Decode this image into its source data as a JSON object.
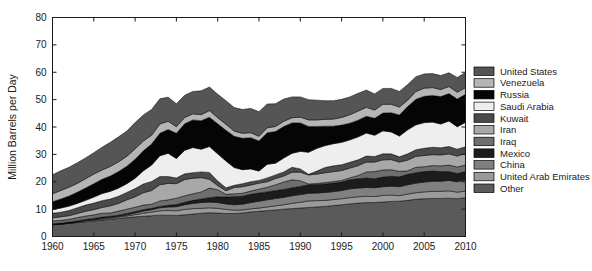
{
  "chart_data": {
    "type": "area",
    "title": "",
    "subtitle": "",
    "xlabel": "",
    "ylabel": "Million Barrels per Day",
    "xlim": [
      1960,
      2010
    ],
    "ylim": [
      0,
      80
    ],
    "xticks": [
      1960,
      1965,
      1970,
      1975,
      1980,
      1985,
      1990,
      1995,
      2000,
      2005,
      2010
    ],
    "yticks": [
      0,
      10,
      20,
      30,
      40,
      50,
      60,
      70,
      80
    ],
    "xtick_labels": [
      "1960",
      "1965",
      "1970",
      "1975",
      "1980",
      "1985",
      "1990",
      "1995",
      "2000",
      "2005",
      "2010"
    ],
    "ytick_labels": [
      "0",
      "10",
      "20",
      "30",
      "40",
      "50",
      "60",
      "70",
      "80"
    ],
    "grid": false,
    "stacked": true,
    "legend_position": "right",
    "x": [
      1960,
      1961,
      1962,
      1963,
      1964,
      1965,
      1966,
      1967,
      1968,
      1969,
      1970,
      1971,
      1972,
      1973,
      1974,
      1975,
      1976,
      1977,
      1978,
      1979,
      1980,
      1981,
      1982,
      1983,
      1984,
      1985,
      1986,
      1987,
      1988,
      1989,
      1990,
      1991,
      1992,
      1993,
      1994,
      1995,
      1996,
      1997,
      1998,
      1999,
      2000,
      2001,
      2002,
      2003,
      2004,
      2005,
      2006,
      2007,
      2008,
      2009,
      2010
    ],
    "series": [
      {
        "name": "Other",
        "color": "#5a5a5a",
        "values": [
          4.3,
          4.5,
          4.8,
          5.1,
          5.4,
          5.7,
          6.0,
          6.3,
          6.6,
          6.9,
          7.2,
          7.4,
          7.6,
          7.8,
          7.8,
          7.7,
          7.9,
          8.2,
          8.5,
          8.7,
          8.6,
          8.4,
          8.4,
          8.6,
          9.0,
          9.2,
          9.5,
          9.7,
          10.0,
          10.2,
          10.4,
          10.6,
          10.8,
          11.0,
          11.3,
          11.6,
          11.9,
          12.2,
          12.4,
          12.4,
          12.6,
          12.8,
          12.9,
          13.2,
          13.6,
          13.8,
          13.9,
          13.9,
          14.0,
          13.8,
          14.2
        ]
      },
      {
        "name": "United Arab Emirates",
        "color": "#9a9a9a",
        "values": [
          0.0,
          0.0,
          0.1,
          0.2,
          0.3,
          0.3,
          0.4,
          0.4,
          0.5,
          0.6,
          0.8,
          1.1,
          1.3,
          1.6,
          1.7,
          1.7,
          2.0,
          2.0,
          1.8,
          1.8,
          1.7,
          1.5,
          1.2,
          1.1,
          1.1,
          1.2,
          1.3,
          1.5,
          1.6,
          1.9,
          2.1,
          2.4,
          2.3,
          2.2,
          2.2,
          2.2,
          2.3,
          2.3,
          2.3,
          2.2,
          2.4,
          2.3,
          2.0,
          2.3,
          2.4,
          2.5,
          2.6,
          2.6,
          2.7,
          2.4,
          2.4
        ]
      },
      {
        "name": "China",
        "color": "#808080",
        "values": [
          0.1,
          0.1,
          0.1,
          0.1,
          0.2,
          0.2,
          0.3,
          0.3,
          0.3,
          0.4,
          0.6,
          0.8,
          0.9,
          1.1,
          1.3,
          1.5,
          1.7,
          1.9,
          2.1,
          2.1,
          2.1,
          2.0,
          2.0,
          2.1,
          2.3,
          2.5,
          2.6,
          2.7,
          2.7,
          2.8,
          2.8,
          2.8,
          2.8,
          2.9,
          2.9,
          3.0,
          3.2,
          3.2,
          3.2,
          3.2,
          3.2,
          3.3,
          3.3,
          3.4,
          3.5,
          3.6,
          3.7,
          3.7,
          3.8,
          3.8,
          4.1
        ]
      },
      {
        "name": "Mexico",
        "color": "#1c1c1c",
        "values": [
          0.3,
          0.3,
          0.3,
          0.3,
          0.3,
          0.4,
          0.4,
          0.4,
          0.4,
          0.5,
          0.5,
          0.5,
          0.5,
          0.5,
          0.6,
          0.8,
          0.9,
          1.1,
          1.3,
          1.6,
          2.1,
          2.5,
          3.0,
          2.9,
          3.0,
          3.0,
          2.9,
          2.9,
          2.9,
          2.9,
          3.0,
          3.1,
          3.1,
          3.1,
          3.1,
          3.1,
          3.3,
          3.4,
          3.5,
          3.3,
          3.5,
          3.6,
          3.6,
          3.8,
          3.8,
          3.8,
          3.7,
          3.5,
          3.2,
          3.0,
          3.0
        ]
      },
      {
        "name": "Iraq",
        "color": "#6e6e6e",
        "values": [
          1.0,
          1.0,
          1.0,
          1.2,
          1.3,
          1.3,
          1.4,
          1.2,
          1.5,
          1.6,
          1.6,
          1.7,
          1.5,
          2.0,
          2.0,
          2.3,
          2.4,
          2.4,
          2.6,
          3.5,
          2.6,
          1.0,
          1.0,
          1.1,
          1.2,
          1.4,
          1.7,
          2.1,
          2.7,
          2.9,
          2.1,
          0.3,
          0.4,
          0.5,
          0.6,
          0.6,
          0.7,
          1.2,
          2.2,
          2.6,
          2.6,
          2.4,
          2.0,
          1.3,
          2.0,
          1.8,
          2.0,
          2.1,
          2.4,
          2.4,
          2.4
        ]
      },
      {
        "name": "Iran",
        "color": "#a8a8a8",
        "values": [
          1.1,
          1.3,
          1.3,
          1.5,
          1.7,
          1.9,
          2.1,
          2.6,
          2.8,
          3.4,
          3.8,
          4.5,
          5.0,
          5.9,
          6.0,
          5.3,
          5.9,
          5.7,
          5.2,
          3.2,
          1.5,
          1.3,
          2.3,
          2.4,
          2.2,
          2.2,
          2.0,
          2.3,
          2.2,
          2.8,
          3.1,
          3.3,
          3.4,
          3.6,
          3.6,
          3.6,
          3.6,
          3.6,
          3.6,
          3.5,
          3.7,
          3.7,
          3.4,
          3.9,
          4.0,
          4.1,
          4.0,
          4.0,
          4.1,
          4.0,
          4.2
        ]
      },
      {
        "name": "Kuwait",
        "color": "#4a4a4a",
        "values": [
          1.7,
          1.7,
          1.9,
          2.1,
          2.3,
          2.4,
          2.5,
          2.5,
          2.6,
          2.7,
          3.0,
          3.2,
          3.3,
          3.0,
          2.5,
          2.1,
          2.1,
          2.0,
          2.1,
          2.5,
          1.7,
          1.1,
          0.8,
          1.1,
          1.2,
          1.0,
          1.4,
          1.3,
          1.5,
          1.8,
          1.2,
          0.2,
          1.1,
          1.9,
          2.1,
          2.1,
          2.1,
          2.1,
          2.2,
          2.0,
          2.2,
          2.1,
          1.9,
          2.3,
          2.4,
          2.6,
          2.7,
          2.6,
          2.7,
          2.5,
          2.5
        ]
      },
      {
        "name": "Saudi Arabia",
        "color": "#eeeeee",
        "values": [
          1.3,
          1.5,
          1.6,
          1.6,
          1.7,
          2.2,
          2.6,
          2.8,
          3.0,
          3.2,
          3.8,
          4.8,
          6.0,
          7.6,
          8.5,
          7.1,
          8.6,
          9.2,
          8.3,
          9.5,
          9.9,
          9.8,
          6.5,
          5.1,
          4.7,
          3.4,
          5.0,
          4.3,
          5.1,
          5.1,
          6.4,
          8.1,
          8.3,
          8.0,
          8.1,
          8.2,
          8.2,
          8.4,
          8.4,
          7.8,
          8.4,
          8.0,
          7.6,
          8.8,
          9.1,
          9.4,
          9.2,
          8.7,
          9.3,
          8.2,
          8.9
        ]
      },
      {
        "name": "Russia",
        "color": "#050505",
        "values": [
          2.9,
          3.3,
          3.7,
          4.1,
          4.5,
          4.9,
          5.2,
          5.6,
          6.0,
          6.4,
          6.9,
          7.3,
          7.7,
          8.2,
          8.7,
          9.2,
          9.7,
          10.1,
          10.4,
          10.7,
          11.0,
          11.2,
          11.4,
          11.5,
          11.4,
          11.0,
          11.5,
          11.6,
          11.5,
          11.1,
          10.4,
          9.4,
          8.0,
          7.1,
          6.4,
          6.3,
          6.1,
          6.1,
          6.1,
          6.2,
          6.5,
          7.0,
          7.7,
          8.5,
          9.3,
          9.6,
          9.7,
          10.0,
          10.0,
          10.1,
          10.3
        ]
      },
      {
        "name": "Venezuela",
        "color": "#b5b5b5",
        "values": [
          2.9,
          3.1,
          3.2,
          3.2,
          3.4,
          3.5,
          3.4,
          3.5,
          3.6,
          3.6,
          3.8,
          3.6,
          3.2,
          3.4,
          3.0,
          2.4,
          2.3,
          2.2,
          2.2,
          2.4,
          2.2,
          2.2,
          1.9,
          1.8,
          1.8,
          1.7,
          1.8,
          1.8,
          1.9,
          1.9,
          2.1,
          2.4,
          2.4,
          2.5,
          2.6,
          2.8,
          3.1,
          3.3,
          3.3,
          3.0,
          3.2,
          3.1,
          2.9,
          2.3,
          2.9,
          3.0,
          2.9,
          2.6,
          2.6,
          2.5,
          2.4
        ]
      },
      {
        "name": "United States",
        "color": "#555555",
        "values": [
          7.0,
          7.2,
          7.3,
          7.5,
          7.6,
          7.8,
          8.3,
          8.8,
          9.1,
          9.2,
          9.6,
          9.5,
          9.4,
          9.2,
          8.8,
          8.4,
          8.1,
          8.2,
          8.7,
          8.6,
          8.6,
          8.6,
          8.6,
          8.7,
          8.9,
          9.0,
          8.7,
          8.3,
          8.1,
          7.6,
          7.4,
          7.4,
          7.2,
          6.8,
          6.7,
          6.6,
          6.5,
          6.5,
          6.3,
          5.9,
          5.8,
          5.8,
          5.7,
          5.7,
          5.4,
          5.2,
          5.1,
          5.1,
          5.0,
          5.4,
          5.5
        ]
      }
    ],
    "legend_entries": [
      {
        "label": "United States",
        "color": "#555555"
      },
      {
        "label": "Venezuela",
        "color": "#b5b5b5"
      },
      {
        "label": "Russia",
        "color": "#050505"
      },
      {
        "label": "Saudi Arabia",
        "color": "#eeeeee"
      },
      {
        "label": "Kuwait",
        "color": "#4a4a4a"
      },
      {
        "label": "Iran",
        "color": "#a8a8a8"
      },
      {
        "label": "Iraq",
        "color": "#6e6e6e"
      },
      {
        "label": "Mexico",
        "color": "#1c1c1c"
      },
      {
        "label": "China",
        "color": "#808080"
      },
      {
        "label": "United Arab Emirates",
        "color": "#9a9a9a"
      },
      {
        "label": "Other",
        "color": "#5a5a5a"
      }
    ]
  }
}
